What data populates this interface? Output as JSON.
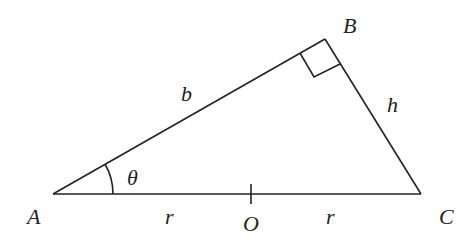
{
  "diagram": {
    "title": "",
    "vertices": {
      "A": {
        "label": "A",
        "x": 53,
        "y": 194
      },
      "B": {
        "label": "B",
        "x": 325,
        "y": 39
      },
      "C": {
        "label": "C",
        "x": 421,
        "y": 194
      },
      "O": {
        "label": "O",
        "x": 251,
        "y": 194
      }
    },
    "sides": {
      "AB": {
        "label": "b"
      },
      "BC": {
        "label": "h"
      },
      "AO": {
        "label": "r"
      },
      "OC": {
        "label": "r"
      }
    },
    "angle_A": {
      "label": "θ"
    },
    "right_angle_at": "B",
    "stroke_color": "#222222"
  }
}
